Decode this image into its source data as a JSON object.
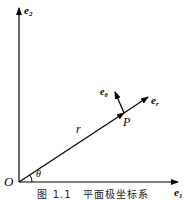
{
  "diagram": {
    "title": "平面极坐标系",
    "labels": {
      "e2": "e",
      "e2_sub": "2",
      "e1": "e",
      "e1_sub": "1",
      "er": "e",
      "er_sub": "r",
      "etheta": "e",
      "etheta_sub": "θ",
      "r": "r",
      "P": "P",
      "O": "O",
      "theta": "θ"
    },
    "caption": "图 1.1　平面极坐标系"
  }
}
